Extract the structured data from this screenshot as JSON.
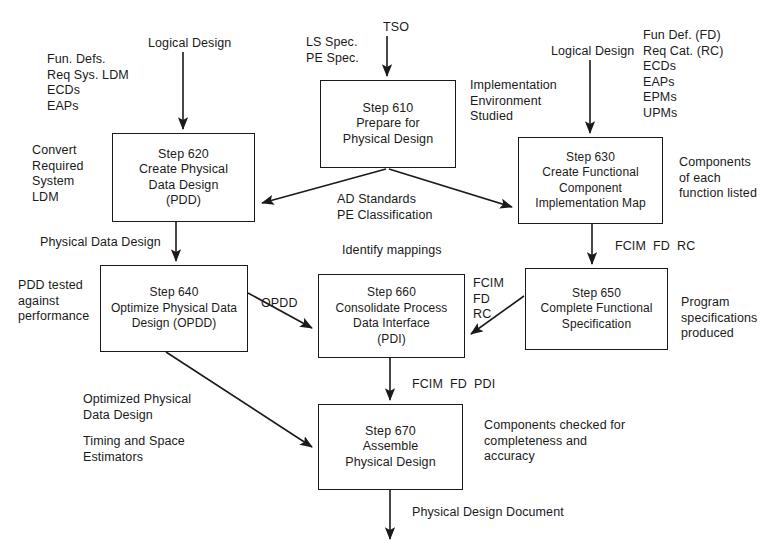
{
  "diagram": {
    "stroke_color": "#1a1a1a",
    "background_color": "#ffffff",
    "nodes": [
      {
        "id": "step610",
        "lines": [
          "Step 610",
          "Prepare for",
          "Physical Design"
        ],
        "x": 320,
        "y": 80,
        "w": 136,
        "h": 88
      },
      {
        "id": "step620",
        "lines": [
          "Step 620",
          "Create Physical",
          "Data Design",
          "(PDD)"
        ],
        "x": 112,
        "y": 133,
        "w": 143,
        "h": 89
      },
      {
        "id": "step630",
        "lines": [
          "Step 630",
          "Create Functional",
          "Component",
          "Implementation Map"
        ],
        "x": 518,
        "y": 137,
        "w": 145,
        "h": 87
      },
      {
        "id": "step640",
        "lines": [
          "Step 640",
          "Optimize Physical Data",
          "Design (OPDD)"
        ],
        "x": 100,
        "y": 265,
        "w": 148,
        "h": 87
      },
      {
        "id": "step660",
        "lines": [
          "Step 660",
          "Consolidate Process",
          "Data Interface",
          "(PDI)"
        ],
        "x": 318,
        "y": 274,
        "w": 147,
        "h": 84
      },
      {
        "id": "step650",
        "lines": [
          "Step 650",
          "Complete Functional",
          "Specification"
        ],
        "x": 525,
        "y": 268,
        "w": 143,
        "h": 82
      },
      {
        "id": "step670",
        "lines": [
          "Step 670",
          "Assemble",
          "Physical Design"
        ],
        "x": 318,
        "y": 404,
        "w": 145,
        "h": 86
      }
    ],
    "annotations": [
      {
        "id": "in-logical-design-620",
        "text": "Logical Design",
        "x": 148,
        "y": 36,
        "align": "left"
      },
      {
        "id": "in-fun-defs-block",
        "text": "Fun. Defs.\nReq Sys. LDM\nECDs\nEAPs",
        "x": 47,
        "y": 52,
        "align": "left"
      },
      {
        "id": "in-ls-pe-spec",
        "text": "LS Spec.\nPE Spec.",
        "x": 306,
        "y": 35,
        "align": "left"
      },
      {
        "id": "in-tso",
        "text": "TSO",
        "x": 383,
        "y": 20,
        "align": "left"
      },
      {
        "id": "in-logical-design-630",
        "text": "Logical Design",
        "x": 551,
        "y": 44,
        "align": "left"
      },
      {
        "id": "in-fun-def-fd-block",
        "text": "Fun Def. (FD)\nReq Cat. (RC)\nECDs\nEAPs\nEPMs\nUPMs",
        "x": 643,
        "y": 28,
        "align": "left"
      },
      {
        "id": "note-implementation-environment",
        "text": "Implementation\nEnvironment\nStudied",
        "x": 470,
        "y": 78,
        "align": "left"
      },
      {
        "id": "note-convert-required-system-ldm",
        "text": "Convert\nRequired\nSystem\nLDM",
        "x": 32,
        "y": 143,
        "align": "left"
      },
      {
        "id": "edge-ad-standards-pe-classification",
        "text": "AD Standards\nPE Classification",
        "x": 337,
        "y": 192,
        "align": "left"
      },
      {
        "id": "note-components-of-each-function",
        "text": "Components\nof each\nfunction listed",
        "x": 679,
        "y": 155,
        "align": "left"
      },
      {
        "id": "edge-physical-data-design",
        "text": "Physical Data Design",
        "x": 40,
        "y": 235,
        "align": "left"
      },
      {
        "id": "note-identify-mappings",
        "text": "Identify mappings",
        "x": 342,
        "y": 243,
        "align": "left"
      },
      {
        "id": "edge-fcim-fd-rc-vertical",
        "text": "FCIM  FD  RC",
        "x": 615,
        "y": 239,
        "align": "left"
      },
      {
        "id": "note-pdd-tested-against-performance",
        "text": "PDD tested\nagainst\nperformance",
        "x": 18,
        "y": 278,
        "align": "left"
      },
      {
        "id": "edge-opddd",
        "text": "OPDD",
        "x": 261,
        "y": 296,
        "align": "left"
      },
      {
        "id": "edge-fcim-fd-rc-stacked",
        "text": "FCIM\nFD\nRC",
        "x": 473,
        "y": 276,
        "align": "left"
      },
      {
        "id": "note-program-specifications-produced",
        "text": "Program\nspecifications\nproduced",
        "x": 681,
        "y": 295,
        "align": "left"
      },
      {
        "id": "note-optimized-physical-data-design",
        "text": "Optimized Physical\nData Design",
        "x": 83,
        "y": 392,
        "align": "left"
      },
      {
        "id": "edge-fcim-fd-pdi",
        "text": "FCIM  FD  PDI",
        "x": 412,
        "y": 377,
        "align": "left"
      },
      {
        "id": "note-timing-and-space-estimators",
        "text": "Timing and Space\nEstimators",
        "x": 83,
        "y": 434,
        "align": "left"
      },
      {
        "id": "note-components-checked",
        "text": "Components checked for\ncompleteness and\naccuracy",
        "x": 484,
        "y": 418,
        "align": "left"
      },
      {
        "id": "out-physical-design-document",
        "text": "Physical Design Document",
        "x": 412,
        "y": 505,
        "align": "left"
      }
    ],
    "edges": [
      {
        "id": "logical-design-to-620",
        "from": "Logical Design",
        "to": "step620",
        "kind": "straight-down"
      },
      {
        "id": "tso-to-610",
        "from": "TSO",
        "to": "step610",
        "kind": "straight-down"
      },
      {
        "id": "logical-design-to-630",
        "from": "Logical Design",
        "to": "step630",
        "kind": "straight-down"
      },
      {
        "id": "610-to-620",
        "from": "step610",
        "to": "step620",
        "label": "AD Standards / PE Classification",
        "kind": "diagonal"
      },
      {
        "id": "610-to-630",
        "from": "step610",
        "to": "step630",
        "label": "AD Standards / PE Classification",
        "kind": "diagonal"
      },
      {
        "id": "620-to-640",
        "from": "step620",
        "to": "step640",
        "label": "Physical Data Design",
        "kind": "straight-down"
      },
      {
        "id": "630-to-650",
        "from": "step630",
        "to": "step650",
        "label": "FCIM  FD  RC",
        "kind": "straight-down"
      },
      {
        "id": "640-to-660",
        "from": "step640",
        "to": "step660",
        "label": "OPDD",
        "kind": "diagonal"
      },
      {
        "id": "650-to-660",
        "from": "step650",
        "to": "step660",
        "label": "FCIM FD RC",
        "kind": "diagonal"
      },
      {
        "id": "640-to-670",
        "from": "step640",
        "to": "step670",
        "label": "Optimized Physical Data Design",
        "kind": "diagonal"
      },
      {
        "id": "660-to-670",
        "from": "step660",
        "to": "step670",
        "label": "FCIM  FD  PDI",
        "kind": "straight-down"
      },
      {
        "id": "670-to-output",
        "from": "step670",
        "to": "Physical Design Document",
        "kind": "straight-down"
      }
    ]
  }
}
